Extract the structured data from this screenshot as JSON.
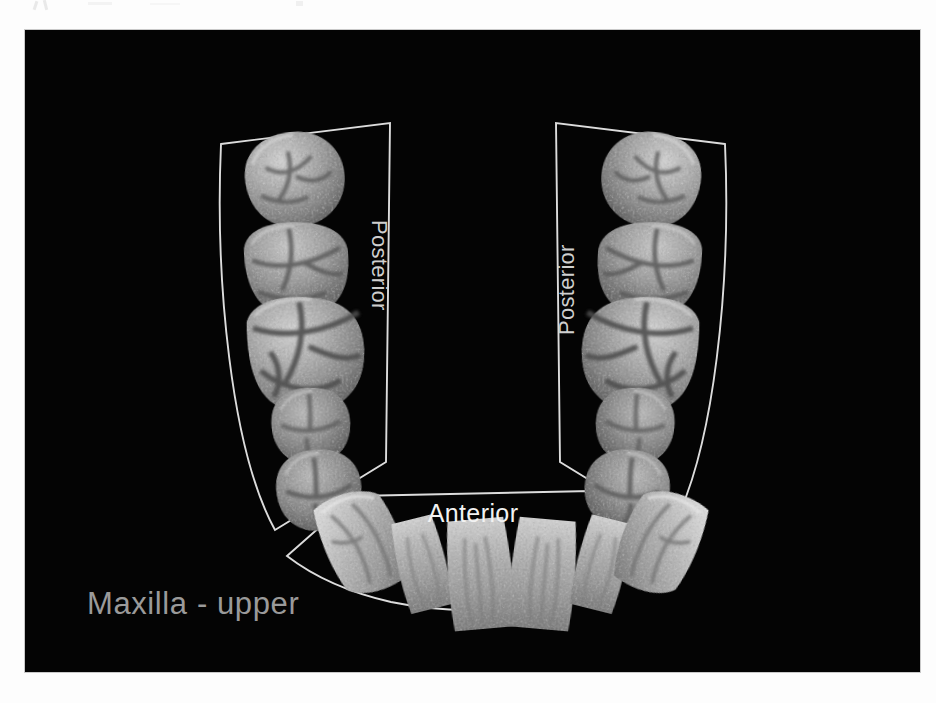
{
  "figure": {
    "kind": "dental-arch-diagram",
    "arch_label": "Maxilla - upper",
    "plate_background": "#040404",
    "outline_color": "#dcdcdc",
    "label_color_bright": "#f2f2f2",
    "label_color_dim": "#9a9a9a",
    "tooth_tone_light": "#c2c2c2",
    "tooth_tone_mid": "#8d8d8d",
    "tooth_tone_dark": "#5a5a5a"
  },
  "regions": {
    "anterior": {
      "label": "Anterior",
      "tooth_count": 6
    },
    "posterior_left": {
      "label": "Posterior",
      "tooth_count": 5,
      "rotation": "90"
    },
    "posterior_right": {
      "label": "Posterior",
      "tooth_count": 5,
      "rotation": "-90"
    }
  },
  "teeth": {
    "posterior_left": [
      {
        "name": "third-molar",
        "position": 1,
        "view": "occlusal"
      },
      {
        "name": "second-molar",
        "position": 2,
        "view": "occlusal"
      },
      {
        "name": "first-molar",
        "position": 3,
        "view": "occlusal"
      },
      {
        "name": "second-premolar",
        "position": 4,
        "view": "occlusal"
      },
      {
        "name": "first-premolar",
        "position": 5,
        "view": "occlusal"
      }
    ],
    "posterior_right": [
      {
        "name": "third-molar",
        "position": 1,
        "view": "occlusal"
      },
      {
        "name": "second-molar",
        "position": 2,
        "view": "occlusal"
      },
      {
        "name": "first-molar",
        "position": 3,
        "view": "occlusal"
      },
      {
        "name": "second-premolar",
        "position": 4,
        "view": "occlusal"
      },
      {
        "name": "first-premolar",
        "position": 5,
        "view": "occlusal"
      }
    ],
    "anterior": [
      {
        "name": "canine-left",
        "position": 1,
        "view": "lingual"
      },
      {
        "name": "lateral-incisor-left",
        "position": 2,
        "view": "lingual"
      },
      {
        "name": "central-incisor-left",
        "position": 3,
        "view": "lingual"
      },
      {
        "name": "central-incisor-right",
        "position": 4,
        "view": "lingual"
      },
      {
        "name": "lateral-incisor-right",
        "position": 5,
        "view": "lingual"
      },
      {
        "name": "canine-right",
        "position": 6,
        "view": "lingual"
      }
    ]
  }
}
